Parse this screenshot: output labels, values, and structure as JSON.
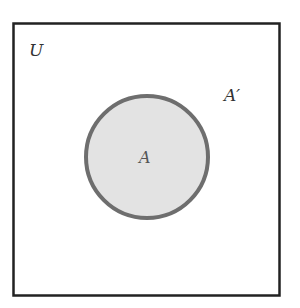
{
  "diagram": {
    "type": "venn",
    "universe": {
      "label": "U",
      "border_color": "#222222"
    },
    "sets": [
      {
        "label": "A",
        "fill": "#e3e3e3",
        "stroke": "#6e6e6e"
      }
    ],
    "complement_label": "A′"
  }
}
